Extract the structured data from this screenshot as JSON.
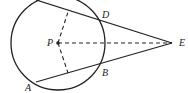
{
  "diagram": {
    "labels": {
      "P": "P",
      "D": "D",
      "E": "E",
      "B": "B",
      "A": "A"
    },
    "colors": {
      "stroke": "#222222",
      "background": "#ffffff"
    }
  }
}
